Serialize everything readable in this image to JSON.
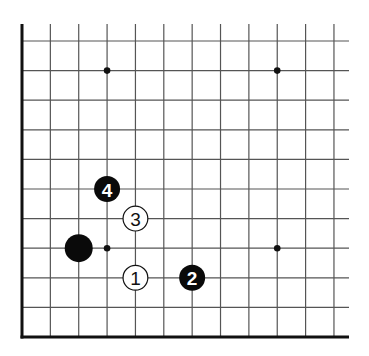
{
  "diagram": {
    "type": "go-board-corner",
    "grid": {
      "columns": 12,
      "rows": 11,
      "origin_x": 22,
      "col_spacing": 28.36,
      "first_row_y": 41,
      "row_spacing": 29.6,
      "top_open_y": 24,
      "right_open_x": 349,
      "line_color": "#555555",
      "edge_color": "#111111"
    },
    "edges": [
      "left",
      "bottom"
    ],
    "star_points": [
      {
        "col": 3,
        "row": 1
      },
      {
        "col": 9,
        "row": 1
      },
      {
        "col": 3,
        "row": 7
      },
      {
        "col": 9,
        "row": 7
      }
    ],
    "stones": [
      {
        "color": "black",
        "col": 2,
        "row": 7,
        "label": "",
        "size": "large"
      },
      {
        "color": "white",
        "col": 4,
        "row": 8,
        "label": "1"
      },
      {
        "color": "black",
        "col": 6,
        "row": 8,
        "label": "2"
      },
      {
        "color": "white",
        "col": 4,
        "row": 6,
        "label": "3"
      },
      {
        "color": "black",
        "col": 3,
        "row": 5,
        "label": "4"
      }
    ]
  }
}
